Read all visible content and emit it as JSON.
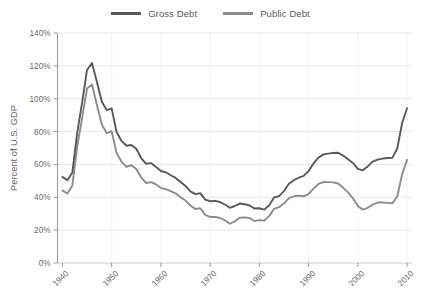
{
  "chart_data": {
    "type": "line",
    "title": "",
    "subtitle": "",
    "xlabel": "",
    "ylabel": "Percent of U.S. GDP",
    "xlim": [
      1939,
      2011
    ],
    "ylim": [
      0,
      140
    ],
    "y_tick_values": [
      0,
      20,
      40,
      60,
      80,
      100,
      120,
      140
    ],
    "y_tick_labels": [
      "0%",
      "20%",
      "40%",
      "60%",
      "80%",
      "100%",
      "120%",
      "140%"
    ],
    "x_tick_values": [
      1940,
      1950,
      1960,
      1970,
      1980,
      1990,
      2000,
      2010
    ],
    "x_tick_labels": [
      "1940",
      "1950",
      "1960",
      "1970",
      "1980",
      "1990",
      "2000",
      "2010"
    ],
    "grid": "horizontal",
    "legend_position": "top-center",
    "x": [
      1940,
      1941,
      1942,
      1943,
      1944,
      1945,
      1946,
      1947,
      1948,
      1949,
      1950,
      1951,
      1952,
      1953,
      1954,
      1955,
      1956,
      1957,
      1958,
      1959,
      1960,
      1961,
      1962,
      1963,
      1964,
      1965,
      1966,
      1967,
      1968,
      1969,
      1970,
      1971,
      1972,
      1973,
      1974,
      1975,
      1976,
      1977,
      1978,
      1979,
      1980,
      1981,
      1982,
      1983,
      1984,
      1985,
      1986,
      1987,
      1988,
      1989,
      1990,
      1991,
      1992,
      1993,
      1994,
      1995,
      1996,
      1997,
      1998,
      1999,
      2000,
      2001,
      2002,
      2003,
      2004,
      2005,
      2006,
      2007,
      2008,
      2009,
      2010
    ],
    "series": [
      {
        "name": "Gross Debt",
        "color": "#595959",
        "values": [
          52.4,
          50.4,
          54.9,
          79.2,
          97.6,
          117.5,
          121.7,
          110.3,
          98.2,
          93.1,
          94.1,
          79.7,
          74.3,
          71.4,
          71.8,
          69.5,
          63.9,
          60.4,
          60.8,
          58.5,
          56.0,
          55.2,
          53.4,
          51.8,
          49.3,
          46.9,
          43.6,
          41.9,
          42.5,
          38.6,
          37.6,
          37.8,
          37.1,
          35.6,
          33.6,
          34.7,
          36.2,
          35.8,
          35.0,
          33.2,
          33.3,
          32.5,
          35.2,
          39.9,
          40.7,
          43.8,
          48.2,
          50.4,
          51.9,
          53.1,
          55.9,
          60.7,
          64.1,
          66.1,
          66.6,
          67.0,
          67.1,
          65.4,
          63.2,
          60.9,
          57.3,
          56.4,
          58.8,
          61.7,
          62.9,
          63.5,
          63.9,
          64.0,
          69.7,
          85.2,
          94.2
        ]
      },
      {
        "name": "Public Debt",
        "color": "#8c8c8c",
        "values": [
          44.2,
          42.3,
          47.0,
          70.9,
          88.3,
          106.2,
          108.6,
          96.2,
          84.3,
          79.0,
          80.2,
          66.9,
          61.6,
          58.6,
          59.5,
          57.2,
          52.0,
          48.7,
          49.2,
          47.9,
          45.6,
          45.0,
          43.7,
          42.4,
          40.0,
          38.0,
          34.9,
          32.9,
          33.3,
          29.3,
          28.0,
          28.1,
          27.4,
          26.0,
          23.9,
          25.3,
          27.5,
          27.8,
          27.4,
          25.6,
          26.1,
          25.8,
          28.7,
          33.0,
          34.0,
          36.3,
          39.5,
          40.6,
          41.0,
          40.6,
          42.1,
          45.3,
          48.1,
          49.3,
          49.2,
          49.1,
          48.4,
          45.9,
          43.0,
          39.4,
          34.7,
          32.5,
          33.6,
          35.6,
          36.8,
          36.9,
          36.6,
          36.3,
          40.5,
          54.1,
          62.8
        ]
      }
    ],
    "annotations": []
  },
  "legend": {
    "entries": [
      {
        "label": "Gross Debt",
        "color": "#595959"
      },
      {
        "label": "Public Debt",
        "color": "#8c8c8c"
      }
    ]
  },
  "axes": {
    "y_title": "Percent of U.S. GDP"
  }
}
